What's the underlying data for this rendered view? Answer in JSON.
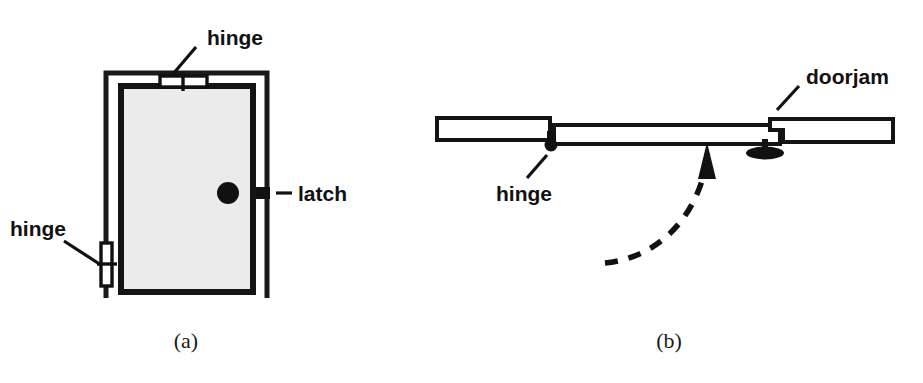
{
  "figure": {
    "background_color": "#ffffff",
    "ink_color": "#111111",
    "door_fill_color": "#ebebeb",
    "width": 923,
    "height": 383
  },
  "panel_a": {
    "caption": "(a)",
    "view": "front elevation of a door in its frame",
    "labels": {
      "hinge_top": "hinge",
      "hinge_left": "hinge",
      "latch": "latch"
    },
    "parts": [
      {
        "name": "door-frame",
        "shape": "open-bottom rectangle"
      },
      {
        "name": "door-panel",
        "shape": "filled rectangle",
        "fill": "#ebebeb"
      },
      {
        "name": "hinge-top",
        "shape": "small horizontal hinge block"
      },
      {
        "name": "hinge-left",
        "shape": "small vertical hinge block"
      },
      {
        "name": "door-knob",
        "shape": "filled circle"
      },
      {
        "name": "latch-mark",
        "shape": "short thick bar on door edge"
      }
    ]
  },
  "panel_b": {
    "caption": "(b)",
    "view": "plan / overhead section of the same door swinging open",
    "labels": {
      "hinge": "hinge",
      "doorjam": "doorjam"
    },
    "parts": [
      {
        "name": "left-jamb-bar",
        "shape": "long thin rectangle"
      },
      {
        "name": "door-leaf-bar",
        "shape": "long thin rectangle"
      },
      {
        "name": "hinge-pivot",
        "shape": "small dark blob"
      },
      {
        "name": "right-doorjam-bar",
        "shape": "notched long thin rectangle"
      },
      {
        "name": "knob-pin",
        "shape": "stem with elliptical base"
      },
      {
        "name": "swing-arrow",
        "shape": "dashed curve with solid arrowhead",
        "style": "dashed",
        "direction": "counter-clockwise toward the door leaf"
      }
    ]
  }
}
